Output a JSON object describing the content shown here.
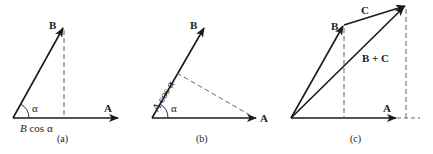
{
  "panels": [
    {
      "id": "a",
      "caption": "(a)",
      "vector_A_label": "A",
      "vector_B_label": "B",
      "angle_label": "α",
      "projection_label_italic": "B",
      "projection_label_rest": " cos α"
    },
    {
      "id": "b",
      "caption": "(b)",
      "vector_A_label": "A",
      "vector_B_label": "B",
      "angle_label": "α",
      "projection_label_italic": "A",
      "projection_label_rest": " cos α"
    },
    {
      "id": "c",
      "caption": "(c)",
      "vector_A_label": "A",
      "vector_B_label": "B",
      "vector_C_label": "C",
      "sum_label": "B + C"
    }
  ],
  "colors": {
    "stroke": "#1a1a1a",
    "dashed": "#555555"
  }
}
